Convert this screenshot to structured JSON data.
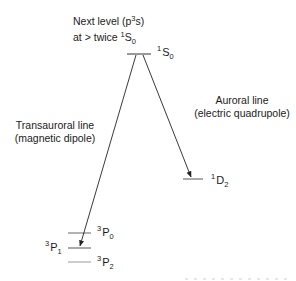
{
  "diagram": {
    "type": "energy-level-diagram",
    "top_note": {
      "line1_prefix": "Next level (p",
      "line1_sup": "3",
      "line1_suffix": "s)",
      "line2_prefix": "at > twice ",
      "line2_sup": "1",
      "line2_main": "S",
      "line2_sub": "0"
    },
    "levels": [
      {
        "id": "1S0",
        "sup": "1",
        "main": "S",
        "sub": "0"
      },
      {
        "id": "1D2",
        "sup": "1",
        "main": "D",
        "sub": "2"
      },
      {
        "id": "3P0",
        "sup": "3",
        "main": "P",
        "sub": "0"
      },
      {
        "id": "3P1",
        "sup": "3",
        "main": "P",
        "sub": "1"
      },
      {
        "id": "3P2",
        "sup": "3",
        "main": "P",
        "sub": "2"
      }
    ],
    "transitions": [
      {
        "from": "1S0",
        "to": "3P1",
        "line1": "Transauroral line",
        "line2": "(magnetic dipole)"
      },
      {
        "from": "1S0",
        "to": "1D2",
        "line1": "Auroral line",
        "line2": "(electric quadrupole)"
      }
    ],
    "colors": {
      "line": "#222222",
      "level_faint": "#9a9a9a",
      "text": "#1a1a1a"
    }
  }
}
